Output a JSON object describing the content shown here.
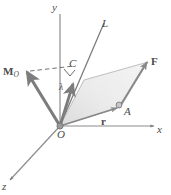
{
  "figure": {
    "background_color": "#ffffff",
    "line_color": "#6e6e6e",
    "vector_color": "#7a7a7a",
    "plane_fill": "#e6e6e6",
    "label_color": "#4a4a4a"
  },
  "axes": [
    {
      "name": "y-axis",
      "label": "y",
      "x": 54,
      "y": 3
    },
    {
      "name": "x-axis",
      "label": "x",
      "x": 158,
      "y": 126
    },
    {
      "name": "z-axis",
      "label": "z",
      "x": 3,
      "y": 183
    }
  ],
  "labels": {
    "line_L": "L",
    "moment_M": "M",
    "moment_M_sub": "O",
    "point_C": "C",
    "unit_vector_lambda": "λ",
    "force_F": "F",
    "point_A": "A",
    "position_r": "r",
    "origin_O": "O"
  },
  "label_positions": {
    "line_L": {
      "x": 103,
      "y": 20
    },
    "moment_M": {
      "x": 4,
      "y": 63
    },
    "point_C": {
      "x": 69,
      "y": 60
    },
    "unit_vector_lambda": {
      "x": 60,
      "y": 85
    },
    "force_F": {
      "x": 150,
      "y": 59
    },
    "point_A": {
      "x": 122,
      "y": 106
    },
    "position_r": {
      "x": 100,
      "y": 116
    },
    "origin_O": {
      "x": 58,
      "y": 130
    }
  },
  "geometry": {
    "origin": {
      "x": 60,
      "y": 126
    },
    "point_A": {
      "x": 118,
      "y": 108
    },
    "point_C": {
      "x": 76,
      "y": 68
    },
    "tip_F": {
      "x": 148,
      "y": 62
    },
    "tip_M": {
      "x": 26,
      "y": 72
    },
    "tip_lambda": {
      "x": 73,
      "y": 83
    },
    "parallelogram": [
      {
        "x": 60,
        "y": 126
      },
      {
        "x": 118,
        "y": 108
      },
      {
        "x": 148,
        "y": 62
      },
      {
        "x": 84,
        "y": 80
      }
    ],
    "line_L_start": {
      "x": 60,
      "y": 126
    },
    "line_L_end": {
      "x": 104,
      "y": 24
    },
    "y_axis_top": {
      "x": 60,
      "y": 14
    },
    "x_axis_end": {
      "x": 152,
      "y": 126
    },
    "z_axis_end": {
      "x": 10,
      "y": 180
    },
    "dashed_from": {
      "x": 30,
      "y": 71
    },
    "dashed_to": {
      "x": 74,
      "y": 66
    },
    "right_angle_mark": {
      "x": 67,
      "y": 72
    }
  }
}
